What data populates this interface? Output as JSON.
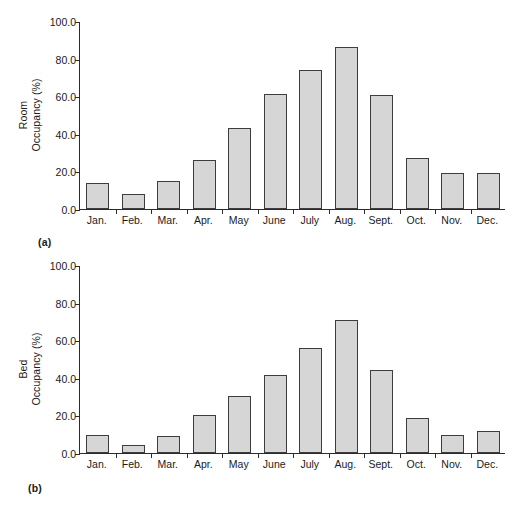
{
  "figure": {
    "panels": [
      {
        "tag": "(a)",
        "ytitle_line1": "Room",
        "ytitle_line2": "Occupancy (%)"
      },
      {
        "tag": "(b)",
        "ytitle_line1": "Bed",
        "ytitle_line2": "Occupancy (%)"
      }
    ],
    "colors": {
      "bar_fill": "#d6d6d6",
      "bar_border": "#3d3d3d",
      "axis": "#2b2b2b",
      "text": "#1a1a1a",
      "background": "#ffffff"
    }
  },
  "chart_data": [
    {
      "type": "bar",
      "panel": "(a)",
      "title": "",
      "xlabel": "",
      "ylabel": "Room Occupancy (%)",
      "categories": [
        "Jan.",
        "Feb.",
        "Mar.",
        "Apr.",
        "May",
        "June",
        "July",
        "Aug.",
        "Sept.",
        "Oct.",
        "Nov.",
        "Dec."
      ],
      "values": [
        14.0,
        8.0,
        15.0,
        26.0,
        43.0,
        61.0,
        74.0,
        86.0,
        60.5,
        27.0,
        19.0,
        19.0
      ],
      "ylim": [
        0,
        100
      ],
      "yticks": [
        0.0,
        20.0,
        40.0,
        60.0,
        80.0,
        100.0
      ],
      "ytick_labels": [
        "0.0",
        "20.0",
        "40.0",
        "60.0",
        "80.0",
        "100.0"
      ],
      "grid": false,
      "legend": false
    },
    {
      "type": "bar",
      "panel": "(b)",
      "title": "",
      "xlabel": "",
      "ylabel": "Bed Occupancy (%)",
      "categories": [
        "Jan.",
        "Feb.",
        "Mar.",
        "Apr.",
        "May",
        "June",
        "July",
        "Aug.",
        "Sept.",
        "Oct.",
        "Nov.",
        "Dec."
      ],
      "values": [
        9.5,
        4.5,
        9.0,
        20.0,
        30.5,
        41.5,
        56.0,
        70.5,
        44.0,
        18.5,
        9.5,
        11.5
      ],
      "ylim": [
        0,
        100
      ],
      "yticks": [
        0.0,
        20.0,
        40.0,
        60.0,
        80.0,
        100.0
      ],
      "ytick_labels": [
        "0.0",
        "20.0",
        "40.0",
        "60.0",
        "80.0",
        "100.0"
      ],
      "grid": false,
      "legend": false
    }
  ]
}
